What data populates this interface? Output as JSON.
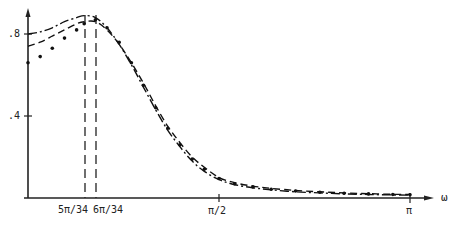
{
  "chart_data": {
    "type": "line",
    "title": "",
    "xlabel": "ω",
    "ylabel": "",
    "xlim": [
      0,
      3.14159
    ],
    "ylim": [
      0,
      0.9
    ],
    "grid": false,
    "legend": null,
    "y_ticks": [
      {
        "value": 0.4,
        "label": ".4"
      },
      {
        "value": 0.8,
        "label": ".8"
      }
    ],
    "x_ticks": [
      {
        "value": 0.462,
        "label": "5π/34"
      },
      {
        "value": 0.5544,
        "label": "6π/34"
      },
      {
        "value": 1.5708,
        "label": "π/2"
      },
      {
        "value": 3.1416,
        "label": "π"
      }
    ],
    "reference_lines": [
      {
        "orientation": "vertical",
        "x": 0.462,
        "style": "dashed",
        "label": "5π/34"
      },
      {
        "orientation": "vertical",
        "x": 0.5544,
        "style": "dashed",
        "label": "6π/34"
      }
    ],
    "x": [
      0,
      0.1,
      0.2,
      0.3,
      0.4,
      0.462,
      0.5544,
      0.65,
      0.75,
      0.85,
      0.95,
      1.05,
      1.15,
      1.25,
      1.35,
      1.45,
      1.5708,
      1.7,
      1.85,
      2.0,
      2.2,
      2.4,
      2.6,
      2.8,
      3.0,
      3.1416
    ],
    "series": [
      {
        "name": "dash-dot curve",
        "style": "dash-dot",
        "values": [
          0.8,
          0.81,
          0.83,
          0.86,
          0.88,
          0.89,
          0.88,
          0.83,
          0.75,
          0.65,
          0.54,
          0.43,
          0.33,
          0.25,
          0.18,
          0.13,
          0.09,
          0.065,
          0.05,
          0.04,
          0.03,
          0.025,
          0.02,
          0.017,
          0.015,
          0.014
        ]
      },
      {
        "name": "dashed curve",
        "style": "dashed",
        "values": [
          0.74,
          0.76,
          0.79,
          0.82,
          0.85,
          0.86,
          0.86,
          0.82,
          0.75,
          0.66,
          0.56,
          0.45,
          0.35,
          0.27,
          0.2,
          0.15,
          0.1,
          0.075,
          0.058,
          0.047,
          0.037,
          0.03,
          0.025,
          0.021,
          0.018,
          0.017
        ]
      },
      {
        "name": "dotted points",
        "style": "dots",
        "values": [
          0.66,
          0.69,
          0.73,
          0.78,
          0.82,
          0.85,
          0.87,
          0.83,
          0.76,
          0.66,
          0.55,
          0.44,
          0.34,
          0.26,
          0.19,
          0.14,
          0.095,
          0.07,
          0.054,
          0.043,
          0.034,
          0.028,
          0.023,
          0.02,
          0.017,
          0.016
        ]
      }
    ]
  },
  "axis": {
    "x_label": "ω",
    "y_tick_08": ".8",
    "y_tick_04": ".4",
    "x_tick_5pi34": "5π/34",
    "x_tick_6pi34": "6π/34",
    "x_tick_pi2": "π/2",
    "x_tick_pi": "π"
  }
}
